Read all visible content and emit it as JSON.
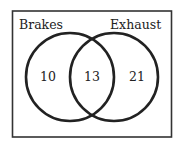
{
  "diagram": {
    "type": "venn",
    "sets": [
      {
        "name": "Brakes",
        "only_count": "10"
      },
      {
        "name": "Exhaust",
        "only_count": "21"
      }
    ],
    "intersection_count": "13",
    "colors": {
      "stroke": "#222222",
      "background": "#ffffff"
    }
  }
}
